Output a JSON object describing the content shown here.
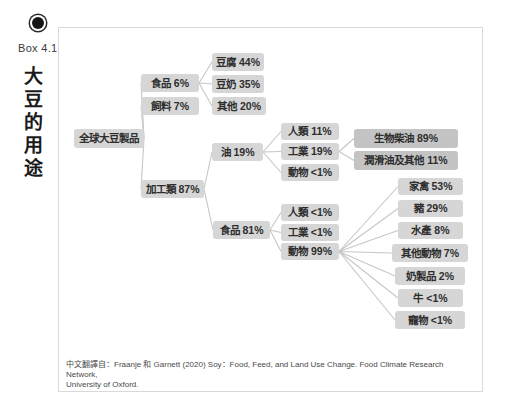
{
  "header": {
    "box_label": "Box 4.1",
    "title": "大豆的用途",
    "icon": "bullseye-icon"
  },
  "footer": {
    "line1": "中文翻譯自：Fraanje 和 Garnett (2020) Soy：Food, Feed, and Land Use Change. Food Climate Research Network,",
    "line2": "University of Oxford."
  },
  "colors": {
    "background": "#ffffff",
    "frame_border": "#d9d9d9",
    "node_fill": "#d6d6d6",
    "node_fill_dark": "#c4c4c4",
    "node_text": "#2e2e2e",
    "edge": "#c6c6c6",
    "title_text": "#1a1a1a",
    "footer_text": "#4a4a4a"
  },
  "diagram": {
    "nodes": [
      {
        "id": "global-soy",
        "label": "全球大豆製品",
        "x": 74,
        "y": 129,
        "w": 70,
        "h": 19
      },
      {
        "id": "food-6",
        "label": "食品 6%",
        "x": 141,
        "y": 74,
        "w": 58,
        "h": 18
      },
      {
        "id": "feed-7",
        "label": "飼料 7%",
        "x": 141,
        "y": 97,
        "w": 58,
        "h": 18
      },
      {
        "id": "processed-87",
        "label": "加工類 87%",
        "x": 141,
        "y": 180,
        "w": 63,
        "h": 18
      },
      {
        "id": "tofu-44",
        "label": "豆腐 44%",
        "x": 212,
        "y": 53,
        "w": 52,
        "h": 18
      },
      {
        "id": "soymilk-35",
        "label": "豆奶 35%",
        "x": 212,
        "y": 75,
        "w": 52,
        "h": 18
      },
      {
        "id": "other-20",
        "label": "其他 20%",
        "x": 212,
        "y": 97,
        "w": 54,
        "h": 18
      },
      {
        "id": "oil-19",
        "label": "油 19%",
        "x": 212,
        "y": 143,
        "w": 51,
        "h": 18
      },
      {
        "id": "food-81",
        "label": "食品 81%",
        "x": 213,
        "y": 221,
        "w": 57,
        "h": 18
      },
      {
        "id": "human-11",
        "label": "人類 11%",
        "x": 281,
        "y": 123,
        "w": 58,
        "h": 17
      },
      {
        "id": "industry-19",
        "label": "工業 19%",
        "x": 281,
        "y": 143,
        "w": 58,
        "h": 17
      },
      {
        "id": "animal-lt1",
        "label": "動物 <1%",
        "x": 281,
        "y": 164,
        "w": 58,
        "h": 17
      },
      {
        "id": "biodiesel-89",
        "label": "生物柴油 89%",
        "x": 354,
        "y": 129,
        "w": 104,
        "h": 19,
        "variant": "dark"
      },
      {
        "id": "lubricant-11",
        "label": "潤滑油及其他 11%",
        "x": 354,
        "y": 151,
        "w": 104,
        "h": 19,
        "variant": "dark"
      },
      {
        "id": "human-lt1",
        "label": "人類 <1%",
        "x": 281,
        "y": 204,
        "w": 58,
        "h": 17
      },
      {
        "id": "industry-lt1",
        "label": "工業 <1%",
        "x": 281,
        "y": 224,
        "w": 58,
        "h": 17
      },
      {
        "id": "animal-99",
        "label": "動物 99%",
        "x": 281,
        "y": 243,
        "w": 58,
        "h": 17
      },
      {
        "id": "poultry-53",
        "label": "家禽 53%",
        "x": 398,
        "y": 178,
        "w": 65,
        "h": 17
      },
      {
        "id": "pig-29",
        "label": "豬 29%",
        "x": 398,
        "y": 200,
        "w": 65,
        "h": 17
      },
      {
        "id": "aqua-8",
        "label": "水產 8%",
        "x": 398,
        "y": 222,
        "w": 65,
        "h": 17
      },
      {
        "id": "other-animal-7",
        "label": "其他動物 7%",
        "x": 392,
        "y": 244,
        "w": 76,
        "h": 18
      },
      {
        "id": "dairy-2",
        "label": "奶製品 2%",
        "x": 395,
        "y": 267,
        "w": 70,
        "h": 18
      },
      {
        "id": "cattle-lt1",
        "label": "牛 <1%",
        "x": 398,
        "y": 289,
        "w": 65,
        "h": 18
      },
      {
        "id": "pet-lt1",
        "label": "寵物 <1%",
        "x": 395,
        "y": 311,
        "w": 70,
        "h": 18
      }
    ],
    "edges": [
      [
        "global-soy",
        "food-6"
      ],
      [
        "global-soy",
        "feed-7"
      ],
      [
        "global-soy",
        "processed-87"
      ],
      [
        "food-6",
        "tofu-44"
      ],
      [
        "food-6",
        "soymilk-35"
      ],
      [
        "food-6",
        "other-20"
      ],
      [
        "processed-87",
        "oil-19"
      ],
      [
        "processed-87",
        "food-81"
      ],
      [
        "oil-19",
        "human-11"
      ],
      [
        "oil-19",
        "industry-19"
      ],
      [
        "oil-19",
        "animal-lt1"
      ],
      [
        "industry-19",
        "biodiesel-89"
      ],
      [
        "industry-19",
        "lubricant-11"
      ],
      [
        "food-81",
        "human-lt1"
      ],
      [
        "food-81",
        "industry-lt1"
      ],
      [
        "food-81",
        "animal-99"
      ],
      [
        "animal-99",
        "poultry-53"
      ],
      [
        "animal-99",
        "pig-29"
      ],
      [
        "animal-99",
        "aqua-8"
      ],
      [
        "animal-99",
        "other-animal-7"
      ],
      [
        "animal-99",
        "dairy-2"
      ],
      [
        "animal-99",
        "cattle-lt1"
      ],
      [
        "animal-99",
        "pet-lt1"
      ]
    ]
  }
}
